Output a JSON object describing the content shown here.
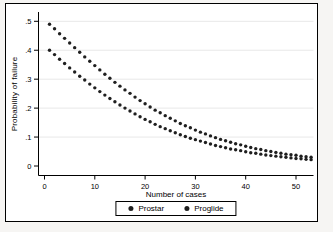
{
  "figure": {
    "outer_background": "#f6f5f3",
    "plot_background": "#ffffff",
    "border_color": "#000000"
  },
  "chart_data": {
    "type": "scatter",
    "title": "",
    "xlabel": "Number of cases",
    "ylabel": "Probability of failure",
    "xlim": [
      0,
      55
    ],
    "ylim": [
      0,
      0.52
    ],
    "grid": "horizontal-light",
    "gridline_color": "#e8e8e8",
    "marker_color": "#1f1f1f",
    "legend_position": "bottom-center",
    "xticks": {
      "values": [
        0,
        10,
        20,
        30,
        40,
        50
      ],
      "labels": [
        "0",
        "10",
        "20",
        "30",
        "40",
        "50"
      ]
    },
    "yticks": {
      "values": [
        0,
        0.1,
        0.2,
        0.3,
        0.4,
        0.5
      ],
      "labels": [
        "0",
        ".1",
        ".2",
        ".3",
        ".4",
        ".5"
      ]
    },
    "x": [
      1,
      2,
      3,
      4,
      5,
      6,
      7,
      8,
      9,
      10,
      11,
      12,
      13,
      14,
      15,
      16,
      17,
      18,
      19,
      20,
      21,
      22,
      23,
      24,
      25,
      26,
      27,
      28,
      29,
      30,
      31,
      32,
      33,
      34,
      35,
      36,
      37,
      38,
      39,
      40,
      41,
      42,
      43,
      44,
      45,
      46,
      47,
      48,
      49,
      50,
      51,
      52,
      53
    ],
    "series": [
      {
        "name": "Prostar",
        "values": [
          0.49,
          0.474,
          0.457,
          0.441,
          0.425,
          0.409,
          0.393,
          0.377,
          0.362,
          0.347,
          0.332,
          0.317,
          0.303,
          0.289,
          0.276,
          0.263,
          0.251,
          0.238,
          0.226,
          0.215,
          0.204,
          0.193,
          0.184,
          0.174,
          0.165,
          0.156,
          0.147,
          0.139,
          0.132,
          0.124,
          0.117,
          0.111,
          0.104,
          0.098,
          0.092,
          0.087,
          0.082,
          0.077,
          0.073,
          0.068,
          0.064,
          0.06,
          0.057,
          0.053,
          0.05,
          0.047,
          0.044,
          0.041,
          0.039,
          0.037,
          0.034,
          0.032,
          0.03
        ]
      },
      {
        "name": "Proglide",
        "values": [
          0.4,
          0.385,
          0.369,
          0.354,
          0.339,
          0.325,
          0.31,
          0.297,
          0.283,
          0.27,
          0.257,
          0.245,
          0.233,
          0.222,
          0.211,
          0.2,
          0.19,
          0.18,
          0.17,
          0.161,
          0.153,
          0.144,
          0.136,
          0.129,
          0.122,
          0.115,
          0.108,
          0.102,
          0.096,
          0.091,
          0.086,
          0.081,
          0.076,
          0.071,
          0.067,
          0.063,
          0.059,
          0.056,
          0.053,
          0.049,
          0.046,
          0.044,
          0.041,
          0.038,
          0.036,
          0.034,
          0.032,
          0.03,
          0.028,
          0.026,
          0.025,
          0.023,
          0.022
        ]
      }
    ]
  }
}
